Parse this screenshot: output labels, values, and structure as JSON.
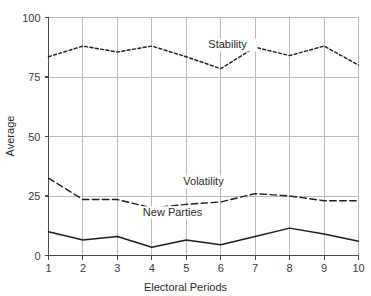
{
  "chart_data": {
    "type": "line",
    "title": "",
    "xlabel": "Electoral Periods",
    "ylabel": "Average",
    "x": [
      1,
      2,
      3,
      4,
      5,
      6,
      7,
      8,
      9,
      10
    ],
    "xticklabels": [
      "1",
      "2",
      "3",
      "4",
      "5",
      "6",
      "7",
      "8",
      "9",
      "10"
    ],
    "yticklabels": [
      "0",
      "25",
      "50",
      "75",
      "100"
    ],
    "yticks": [
      0,
      25,
      50,
      75,
      100
    ],
    "xlim": [
      1,
      10
    ],
    "ylim": [
      0,
      100
    ],
    "grid": "horizontal-and-vertical",
    "legend": "inline-series-labels",
    "series": [
      {
        "name": "Stability",
        "style": "dotted",
        "color": "#1d1d1d",
        "values": [
          83.5,
          88.0,
          85.5,
          88.0,
          83.5,
          78.5,
          87.5,
          84.0,
          88.0,
          80.0
        ],
        "label_x": 6.2,
        "label_y": 87.0
      },
      {
        "name": "Volatility",
        "style": "dashed",
        "color": "#1d1d1d",
        "values": [
          32.5,
          23.5,
          23.5,
          20.0,
          21.5,
          22.5,
          26.0,
          25.0,
          23.0,
          23.0
        ],
        "label_x": 5.5,
        "label_y": 29.5
      },
      {
        "name": "New Parties",
        "style": "solid",
        "color": "#1d1d1d",
        "values": [
          10.0,
          6.5,
          8.0,
          3.5,
          6.5,
          4.5,
          8.0,
          11.5,
          9.0,
          6.0
        ],
        "label_x": 4.6,
        "label_y": 16.5
      }
    ]
  },
  "axes": {
    "y_axis_label": "Average",
    "x_axis_label": "Electoral Periods"
  },
  "colors": {
    "background": "#ffffff",
    "grid": "#b9b9b9",
    "axis": "#4a4a4a",
    "series": "#1d1d1d",
    "text": "#2b2b2b"
  }
}
